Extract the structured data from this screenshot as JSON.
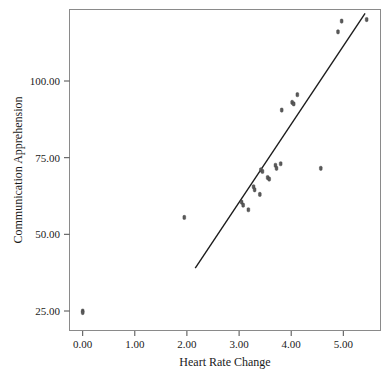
{
  "chart_data": {
    "type": "scatter",
    "title": "",
    "xlabel": "Heart Rate Change",
    "ylabel": "Communication Apprehension",
    "xlim": [
      -0.26,
      5.73
    ],
    "ylim": [
      21.0,
      123.0
    ],
    "xticks": [
      0,
      1,
      2,
      3,
      4,
      5
    ],
    "xtick_labels": [
      "0.00",
      "1.00",
      "2.00",
      "3.00",
      "4.00",
      "5.00"
    ],
    "yticks": [
      25,
      50,
      75,
      100
    ],
    "ytick_labels": [
      "25.00",
      "50.00",
      "75.00",
      "100.00"
    ],
    "grid": false,
    "legend": null,
    "marker": "small-dark-dot",
    "points": [
      {
        "x": 0.0,
        "y": 25.0
      },
      {
        "x": 0.0,
        "y": 24.5
      },
      {
        "x": 1.95,
        "y": 55.5
      },
      {
        "x": 3.05,
        "y": 60.5
      },
      {
        "x": 3.08,
        "y": 59.5
      },
      {
        "x": 3.18,
        "y": 58.0
      },
      {
        "x": 3.28,
        "y": 65.5
      },
      {
        "x": 3.3,
        "y": 64.5
      },
      {
        "x": 3.4,
        "y": 63.0
      },
      {
        "x": 3.42,
        "y": 71.0
      },
      {
        "x": 3.45,
        "y": 70.5
      },
      {
        "x": 3.55,
        "y": 68.5
      },
      {
        "x": 3.58,
        "y": 68.0
      },
      {
        "x": 3.7,
        "y": 72.5
      },
      {
        "x": 3.72,
        "y": 71.5
      },
      {
        "x": 3.8,
        "y": 73.0
      },
      {
        "x": 3.82,
        "y": 90.5
      },
      {
        "x": 4.02,
        "y": 93.0
      },
      {
        "x": 4.05,
        "y": 92.5
      },
      {
        "x": 4.12,
        "y": 95.5
      },
      {
        "x": 4.57,
        "y": 71.5
      },
      {
        "x": 4.9,
        "y": 116.0
      },
      {
        "x": 4.97,
        "y": 119.5
      },
      {
        "x": 5.45,
        "y": 120.0
      }
    ],
    "fit_line": {
      "type": "linear-regression",
      "x_start": 2.16,
      "y_start": 39.0,
      "x_end": 5.42,
      "y_end": 122.0
    },
    "colors": {
      "point": "#5a5a5a",
      "line": "#1c1c1c",
      "frame": "#8a8a8a",
      "text": "#1a1a1a",
      "background": "#ffffff"
    }
  }
}
